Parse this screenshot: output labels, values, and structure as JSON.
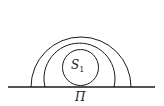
{
  "diagram": {
    "labels": {
      "sphere": "S",
      "sphere_subscript": "1",
      "plane": "Π"
    },
    "colors": {
      "stroke": "#1a1a1a",
      "background": "#ffffff"
    }
  }
}
